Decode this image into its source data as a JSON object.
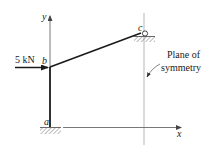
{
  "diagram": {
    "type": "structural frame with roller support and symmetry plane",
    "load_label": "5 kN",
    "nodes": {
      "a": "a",
      "b": "b",
      "c": "c"
    },
    "axes": {
      "x": "x",
      "y": "y"
    },
    "annotation": {
      "line1": "Plane of",
      "line2": "symmetry"
    },
    "supports": {
      "a": "fixed",
      "c": "roller"
    },
    "colors": {
      "member": "#1a1a1a",
      "axis": "#555555",
      "symmetry_line": "#9a9a9a",
      "hatch": "#777777"
    }
  }
}
